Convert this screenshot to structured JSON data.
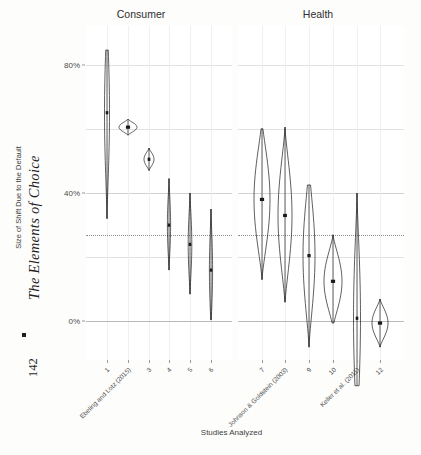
{
  "book": {
    "title": "The Elements of Choice",
    "page_number": "142",
    "separator_icon": "square-bullet"
  },
  "figure": {
    "y_axis_title": "Size of Shift Due to the Default",
    "x_axis_title": "Studies Analyzed",
    "facets": [
      {
        "key": "consumer",
        "label": "Consumer"
      },
      {
        "key": "health",
        "label": "Health"
      }
    ],
    "y_ticks": [
      {
        "label": "80%",
        "value": 80
      },
      {
        "label": "40%",
        "value": 40
      },
      {
        "label": "0%",
        "value": 0
      }
    ],
    "x_tick_labels": [
      "1",
      "Ebeling and Lotz (2015)",
      "3",
      "4",
      "5",
      "6",
      "7",
      "Johnson & Goldstein (2003)",
      "9",
      "10",
      "Keller et al. (2011)",
      "12"
    ]
  },
  "chart_data": {
    "type": "violin",
    "title": "",
    "xlabel": "Studies Analyzed",
    "ylabel": "Size of Shift Due to the Default",
    "ylim": [
      -12,
      92
    ],
    "y_tick_values": [
      0,
      40,
      80
    ],
    "y_tick_labels": [
      "0%",
      "40%",
      "80%"
    ],
    "grid": true,
    "legend": "none",
    "reference_line": {
      "value": 27,
      "style": "dotted",
      "label": ""
    },
    "zero_line": {
      "value": 0,
      "style": "solid"
    },
    "facet_variable": "Domain",
    "facets": [
      "Consumer",
      "Health"
    ],
    "categories": [
      "1",
      "Ebeling and Lotz (2015)",
      "3",
      "4",
      "5",
      "6",
      "7",
      "Johnson & Goldstein (2003)",
      "9",
      "10",
      "Keller et al. (2011)",
      "12"
    ],
    "series": [
      {
        "name": "Estimated shift",
        "points": [
          {
            "x": 1,
            "facet": "Consumer",
            "estimate": 65.0,
            "low": 84.5,
            "high": 32.0,
            "width": 2.5,
            "shape": "narrow-spindle"
          },
          {
            "x": 2,
            "facet": "Consumer",
            "estimate": 60.5,
            "low": 63.0,
            "high": 58.0,
            "width": 9.0,
            "shape": "wide-lens"
          },
          {
            "x": 3,
            "facet": "Consumer",
            "estimate": 50.5,
            "low": 54.0,
            "high": 47.0,
            "width": 5.0,
            "shape": "diamond"
          },
          {
            "x": 4,
            "facet": "Consumer",
            "estimate": 30.0,
            "low": 44.5,
            "high": 16.0,
            "width": 1.6,
            "shape": "narrow-spindle"
          },
          {
            "x": 5,
            "facet": "Consumer",
            "estimate": 24.0,
            "low": 40.0,
            "high": 8.5,
            "width": 1.8,
            "shape": "narrow-spindle"
          },
          {
            "x": 6,
            "facet": "Consumer",
            "estimate": 16.0,
            "low": 35.0,
            "high": 0.5,
            "width": 1.6,
            "shape": "narrow-spindle"
          },
          {
            "x": 7,
            "facet": "Health",
            "estimate": 38.0,
            "low": 60.0,
            "high": 13.0,
            "width": 8.0,
            "shape": "spindle"
          },
          {
            "x": 8,
            "facet": "Health",
            "estimate": 33.0,
            "low": 60.5,
            "high": 6.0,
            "width": 7.0,
            "shape": "spindle"
          },
          {
            "x": 9,
            "facet": "Health",
            "estimate": 20.5,
            "low": 42.5,
            "high": -8.0,
            "width": 6.0,
            "shape": "spindle"
          },
          {
            "x": 10,
            "facet": "Health",
            "estimate": 12.5,
            "low": 27.0,
            "high": -0.5,
            "width": 9.0,
            "shape": "wide-lens"
          },
          {
            "x": 11,
            "facet": "Health",
            "estimate": 1.0,
            "low": 40.0,
            "high": -20.0,
            "width": 3.5,
            "shape": "narrow-spindle"
          },
          {
            "x": 12,
            "facet": "Health",
            "estimate": -0.5,
            "low": 7.0,
            "high": -8.0,
            "width": 8.0,
            "shape": "wide-lens"
          }
        ]
      }
    ]
  },
  "colors": {
    "ink": "#1a1a1a",
    "grid": "#e2e2e2",
    "grid_major": "#d2d2d2",
    "reference": "#8e8e8e",
    "panel_background": "#ffffff",
    "page_background": "#fdfdfc"
  }
}
